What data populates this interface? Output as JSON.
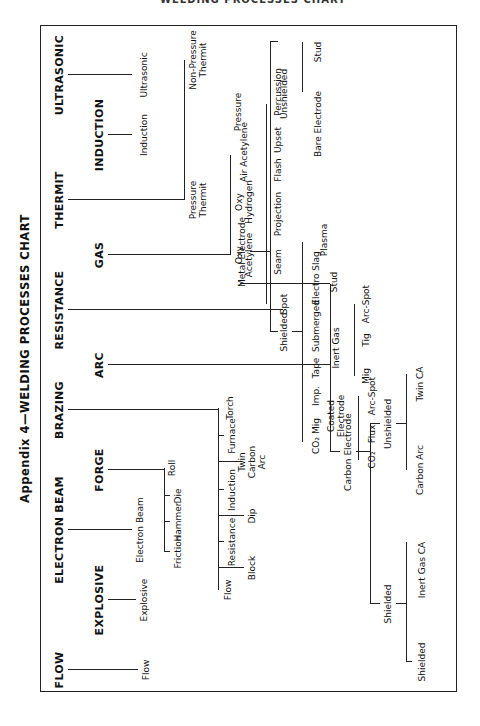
{
  "page": {
    "running_header": "WELDING PROCESSES CHART",
    "page_number": "337"
  },
  "title": "Appendix 4—WELDING PROCESSES CHART",
  "top_level": {
    "flow": "FLOW",
    "explosive": "EXPLOSIVE",
    "electron_beam": "ELECTRON BEAM",
    "forge": "FORGE",
    "brazing": "BRAZING",
    "arc": "ARC",
    "resistance": "RESISTANCE",
    "gas": "GAS",
    "thermit": "THERMIT",
    "induction": "INDUCTION",
    "ultrasonic": "ULTRASONIC"
  },
  "flow": {
    "child": "Flow"
  },
  "explosive": {
    "child": "Explosive"
  },
  "electron_beam": {
    "child": "Electron Beam"
  },
  "forge": {
    "children": [
      "Friction",
      "Hammer",
      "Die",
      "Roll"
    ]
  },
  "brazing": {
    "children": [
      "Flow",
      "Block",
      "Resistance",
      "Dip",
      "Induction",
      "Twin Carbon Arc",
      "Furnace",
      "Torch"
    ]
  },
  "arc": {
    "carbon_electrode": {
      "label": "Carbon Electrode",
      "shielded": {
        "label": "Shielded",
        "children": [
          "Shielded",
          "Inert Gas CA"
        ]
      },
      "unshielded": {
        "label": "Unshielded",
        "children": [
          "Carbon Arc",
          "Twin CA"
        ]
      }
    },
    "metal_electrode": {
      "label": "Metal Electrode",
      "shielded": {
        "label": "Shielded",
        "children": [
          "CO₂ Mig",
          "Imp.",
          "Tape",
          "Submerged",
          "Electro Slag",
          "Plasma"
        ],
        "coated_electrode": {
          "label": "Coated Electrode",
          "children": [
            "CO₂",
            "Flux",
            "Arc-Spot"
          ]
        },
        "inert_gas": {
          "label": "Inert Gas",
          "children": [
            "Mig",
            "Tig",
            "Arc-Spot"
          ]
        },
        "stud": "Stud"
      },
      "unshielded": {
        "label": "Unshielded",
        "bare_electrode": "Bare Electrode",
        "stud": "Stud"
      }
    }
  },
  "resistance": {
    "children": [
      "Spot",
      "Seam",
      "Projection",
      "Flash",
      "Upset",
      "Percussion"
    ]
  },
  "gas": {
    "children": [
      "Oxy Acetylene",
      "Oxy Hydrogen",
      "Air Acetylene",
      "Pressure"
    ]
  },
  "thermit": {
    "children": [
      "Pressure Thermit",
      "Non-Pressure Thermit"
    ]
  },
  "induction": {
    "child": "Induction"
  },
  "ultrasonic": {
    "child": "Ultrasonic"
  }
}
